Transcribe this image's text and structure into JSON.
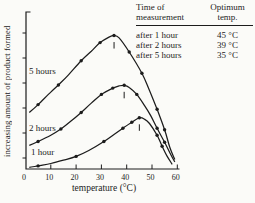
{
  "colors": {
    "ink": "#1c1c1c",
    "background": "#fbfbf8"
  },
  "chart_data": {
    "type": "line",
    "xlabel": "temperature (°C)",
    "ylabel": "increasing amount of product formed",
    "xlim": [
      0,
      60
    ],
    "ylim": [
      0,
      100
    ],
    "x_ticks": [
      0,
      10,
      20,
      30,
      40,
      50,
      60
    ],
    "y_axis_note": "",
    "series": [
      {
        "name": "5 hours",
        "optimum_temp_c": 35,
        "points": [
          [
            1.5,
            36
          ],
          [
            5,
            41
          ],
          [
            10,
            49
          ],
          [
            13,
            53.5
          ],
          [
            17,
            60
          ],
          [
            22,
            69
          ],
          [
            26,
            75
          ],
          [
            29.5,
            80.5
          ],
          [
            33,
            84
          ],
          [
            35,
            85
          ],
          [
            37,
            83.5
          ],
          [
            41,
            74.5
          ],
          [
            46,
            61
          ],
          [
            49,
            50
          ],
          [
            52,
            38
          ],
          [
            55,
            25
          ],
          [
            57,
            14
          ],
          [
            59,
            6
          ]
        ],
        "marker_temps": [
          5,
          13,
          22,
          29.5,
          35,
          41,
          46,
          52,
          55
        ]
      },
      {
        "name": "2 hours",
        "optimum_temp_c": 39,
        "points": [
          [
            1.5,
            15
          ],
          [
            5,
            17.5
          ],
          [
            10,
            21.5
          ],
          [
            14,
            25.5
          ],
          [
            18,
            30.5
          ],
          [
            22,
            36
          ],
          [
            26,
            42
          ],
          [
            30,
            47.5
          ],
          [
            34.5,
            51.5
          ],
          [
            37,
            52.9
          ],
          [
            39,
            53.3
          ],
          [
            41,
            52
          ],
          [
            44,
            47.5
          ],
          [
            47,
            40.5
          ],
          [
            49.5,
            34
          ],
          [
            52,
            26
          ],
          [
            55,
            17
          ],
          [
            57,
            10.5
          ],
          [
            59,
            4.5
          ]
        ],
        "marker_temps": [
          5,
          14,
          22,
          30,
          34.5,
          39,
          44,
          52,
          55
        ]
      },
      {
        "name": "1 hour",
        "optimum_temp_c": 45,
        "points": [
          [
            1.5,
            1
          ],
          [
            5,
            2
          ],
          [
            10,
            3.5
          ],
          [
            15,
            5.6
          ],
          [
            20,
            8
          ],
          [
            25,
            11.8
          ],
          [
            31,
            17.5
          ],
          [
            35,
            22
          ],
          [
            38.5,
            26
          ],
          [
            42,
            29.8
          ],
          [
            45,
            32.6
          ],
          [
            47,
            31.8
          ],
          [
            49,
            29
          ],
          [
            52,
            21.5
          ],
          [
            54,
            14.5
          ],
          [
            56,
            8
          ],
          [
            58,
            3
          ]
        ],
        "marker_temps": [
          5,
          20,
          31,
          38.5,
          42,
          45,
          52,
          54
        ]
      }
    ]
  },
  "table": {
    "headers": [
      {
        "line1": "Time of",
        "line2": "measurement"
      },
      {
        "line1": "Optimum",
        "line2": "temp."
      }
    ],
    "rows": [
      {
        "time": "after 1 hour",
        "temp": "45 °C"
      },
      {
        "time": "after 2 hours",
        "temp": "39 °C"
      },
      {
        "time": "after 5 hours",
        "temp": "35 °C"
      }
    ]
  }
}
